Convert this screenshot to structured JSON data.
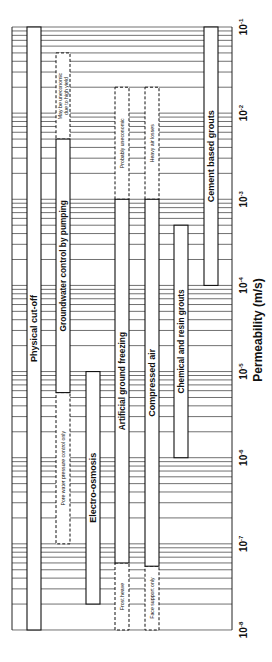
{
  "chart_data": {
    "type": "bar",
    "orientation": "rotated-90 (horizontal range bars on log axis)",
    "title": "",
    "xlabel": "Permeability (m/s)",
    "ylabel": "",
    "axis_scale": "log10",
    "xlim": [
      1e-08,
      0.1
    ],
    "grid": true,
    "ticks": [
      {
        "exp": "-8",
        "label": "10-8"
      },
      {
        "exp": "-7",
        "label": "10-7"
      },
      {
        "exp": "-6",
        "label": "10-6"
      },
      {
        "exp": "-5",
        "label": "10-5"
      },
      {
        "exp": "-4",
        "label": "10-4"
      },
      {
        "exp": "-3",
        "label": "10-3"
      },
      {
        "exp": "-2",
        "label": "10-2"
      },
      {
        "exp": "-1",
        "label": "10-1"
      }
    ],
    "series": [
      {
        "name": "Physical cut-off",
        "solid": [
          1e-08,
          0.1
        ],
        "dashed": []
      },
      {
        "name": "Groundwater control by pumping",
        "solid": [
          5.7e-06,
          0.005
        ],
        "dashed": [
          {
            "range": [
              1e-07,
              5.7e-06
            ],
            "note": "Pore water pressure control only"
          },
          {
            "range": [
              0.005,
              0.05
            ],
            "note": "May be uneconomic due to high yield"
          }
        ]
      },
      {
        "name": "Electro-osmosis",
        "solid": [
          2e-08,
          1e-05
        ],
        "dashed": []
      },
      {
        "name": "Artificial ground freezing",
        "solid": [
          6e-08,
          0.001
        ],
        "dashed": [
          {
            "range": [
              1e-08,
              6e-08
            ],
            "note": "Frost heave"
          },
          {
            "range": [
              0.001,
              0.02
            ],
            "note": "Probably uneconomic"
          }
        ]
      },
      {
        "name": "Compressed air",
        "solid": [
          5.5e-08,
          0.001
        ],
        "dashed": [
          {
            "range": [
              1e-08,
              5.5e-08
            ],
            "note": "Face support only"
          },
          {
            "range": [
              0.001,
              0.02
            ],
            "note": "Heavy air losses"
          }
        ]
      },
      {
        "name": "Chemical and resin grouts",
        "solid": [
          1e-06,
          0.0005
        ],
        "dashed": []
      },
      {
        "name": "Cement based grouts",
        "solid": [
          0.0001,
          0.1
        ],
        "dashed": []
      }
    ]
  }
}
